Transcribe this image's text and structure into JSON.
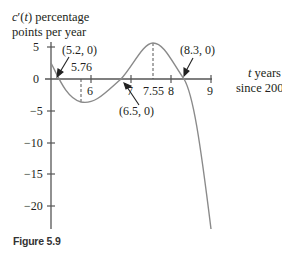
{
  "chart_data": {
    "type": "line",
    "title": "",
    "ylabel_line1": "c′(t) percentage",
    "ylabel_line2": "points per year",
    "xlabel_line1": "t years",
    "xlabel_line2": "since 2000",
    "xlim": [
      5,
      9
    ],
    "ylim": [
      -23,
      6
    ],
    "x_ticks": [
      5,
      6,
      7,
      8,
      9
    ],
    "x_tick_labels": [
      "6",
      "7",
      "7.55",
      "8",
      "9"
    ],
    "y_ticks": [
      5,
      0,
      -5,
      -10,
      -15,
      -20
    ],
    "y_tick_labels": [
      "5",
      "0",
      "−5",
      "−10",
      "−15",
      "−20"
    ],
    "grid": false,
    "series": [
      {
        "name": "c′(t)",
        "x": [
          5.0,
          5.2,
          5.5,
          5.76,
          6.0,
          6.5,
          7.0,
          7.55,
          8.0,
          8.3,
          8.6,
          9.0
        ],
        "y": [
          2.5,
          0,
          -2.8,
          -3.6,
          -3.0,
          0,
          3.8,
          5.6,
          3.5,
          0,
          -6.5,
          -23
        ]
      }
    ],
    "annotations": [
      {
        "text": "(5.2, 0)",
        "x": 5.2,
        "y": 0
      },
      {
        "text": "5.76",
        "x": 5.76,
        "y": -3.6,
        "dashed_line": true
      },
      {
        "text": "(6.5, 0)",
        "x": 6.5,
        "y": 0
      },
      {
        "text": "7.55",
        "x": 7.55,
        "y": 5.6,
        "dashed_line": true
      },
      {
        "text": "(8.3, 0)",
        "x": 8.3,
        "y": 0
      }
    ]
  },
  "caption": "Figure 5.9",
  "labels": {
    "y_title_1": "c′(t) percentage",
    "y_title_2": "points per year",
    "x_title_1": "t years",
    "x_title_2": "since 2000",
    "ann_52": "(5.2, 0)",
    "ann_576": "5.76",
    "ann_65": "(6.5, 0)",
    "ann_83": "(8.3, 0)",
    "tick_6": "6",
    "tick_7": "7",
    "tick_755": "7.55",
    "tick_8": "8",
    "tick_9": "9",
    "y5": "5",
    "y0": "0",
    "ym5": "−5",
    "ym10": "−10",
    "ym15": "−15",
    "ym20": "−20"
  }
}
